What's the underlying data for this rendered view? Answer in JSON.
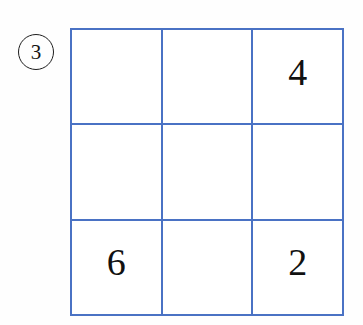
{
  "puzzle": {
    "marker": {
      "label": "3",
      "shape": "circle"
    },
    "grid": {
      "rows": 3,
      "columns": 3,
      "border_color": "#4a72c4",
      "cell_background": "#ffffff",
      "digit_color": "#111111",
      "cells": [
        {
          "row": 0,
          "col": 0,
          "value": ""
        },
        {
          "row": 0,
          "col": 1,
          "value": ""
        },
        {
          "row": 0,
          "col": 2,
          "value": "4"
        },
        {
          "row": 1,
          "col": 0,
          "value": ""
        },
        {
          "row": 1,
          "col": 1,
          "value": ""
        },
        {
          "row": 1,
          "col": 2,
          "value": ""
        },
        {
          "row": 2,
          "col": 0,
          "value": "6"
        },
        {
          "row": 2,
          "col": 1,
          "value": ""
        },
        {
          "row": 2,
          "col": 2,
          "value": "2"
        }
      ]
    }
  }
}
